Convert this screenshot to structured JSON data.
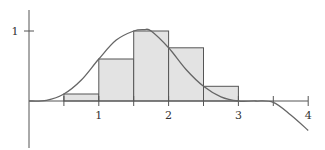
{
  "chart_data": {
    "type": "bar",
    "subtype": "riemann-sum-with-curve",
    "title": "",
    "xlabel": "",
    "ylabel": "",
    "x_ticks": [
      1,
      2,
      3,
      4
    ],
    "x_tick_labels": [
      "1",
      "2",
      "3",
      "4"
    ],
    "minor_x_ticks": [
      0.5,
      1.5,
      2.5,
      3.5
    ],
    "y_ticks": [
      1
    ],
    "y_tick_labels": [
      "1"
    ],
    "xlim": [
      0,
      4
    ],
    "ylim": [
      -0.5,
      1.2
    ],
    "grid": false,
    "legend": null,
    "bars": [
      {
        "x_left": 0.5,
        "x_right": 1.0,
        "height": 0.1
      },
      {
        "x_left": 1.0,
        "x_right": 1.5,
        "height": 0.6
      },
      {
        "x_left": 1.5,
        "x_right": 2.0,
        "height": 1.0
      },
      {
        "x_left": 2.0,
        "x_right": 2.5,
        "height": 0.76
      },
      {
        "x_left": 2.5,
        "x_right": 3.0,
        "height": 0.21
      }
    ],
    "curve": {
      "x": [
        0,
        0.25,
        0.5,
        0.75,
        1.0,
        1.25,
        1.5,
        1.65,
        1.75,
        2.0,
        2.25,
        2.5,
        2.75,
        3.0,
        3.25,
        3.5,
        3.75,
        4.0
      ],
      "y": [
        0,
        0.01,
        0.1,
        0.3,
        0.6,
        0.87,
        1.0,
        1.02,
        1.0,
        0.76,
        0.45,
        0.21,
        0.06,
        0.0,
        0.0,
        -0.02,
        -0.2,
        -0.42
      ]
    },
    "colors": {
      "bar_fill": "#e3e3e3",
      "bar_stroke": "#555555",
      "curve": "#666666",
      "axis": "#555555"
    }
  }
}
